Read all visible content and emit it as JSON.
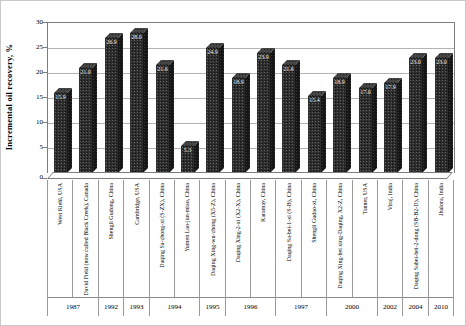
{
  "chart_data": {
    "type": "bar",
    "style": "3d-column",
    "title": "",
    "xlabel": "",
    "ylabel": "Incremental oil recovery, %",
    "ylim": [
      0,
      30
    ],
    "yticks": [
      0,
      5,
      10,
      15,
      20,
      25,
      30
    ],
    "grid": true,
    "legend": false,
    "bar_color": "#2e2e2e",
    "categories": [
      "West Kiehl, USA",
      "David Field (now called Black Creek), Canada",
      "Shengli Gudong, China",
      "Cambridge, USA",
      "Daqing Sa-zhong-xi (S-ZX), China",
      "Yumen Lao-jun-miao, China",
      "Daqing Xing-wu-zhong (X5-Z), China",
      "Daqing Xing-2-xi (X2-X), China",
      "Karamay, China",
      "Daqing Sa-bei-1-xi (S-B), China",
      "Shengli Gudao-xi, China",
      "Daqing Xing-bei xing-Daqing, X2-Z, China",
      "Tanner, USA",
      "Viraj, India",
      "Daqing Sabei-bei-2-dong (SB-B2-D), China",
      "Jhalora, India"
    ],
    "values": [
      15.9,
      21.0,
      26.9,
      28.0,
      21.6,
      5.3,
      24.9,
      18.9,
      23.9,
      21.6,
      15.4,
      18.9,
      17.0,
      17.9,
      23.0,
      23.0
    ],
    "value_labels": [
      "15.9",
      "21.0",
      "26.9",
      "28.0",
      "21.6",
      "5.3",
      "24.9",
      "18.9",
      "23.9",
      "21.6",
      "15.4",
      "18.9",
      "17.0",
      "17.9",
      "23.0",
      "23.0"
    ],
    "year_groups": [
      {
        "label": "1987",
        "span": 2
      },
      {
        "label": "1992",
        "span": 1
      },
      {
        "label": "1993",
        "span": 1
      },
      {
        "label": "1994",
        "span": 2
      },
      {
        "label": "1995",
        "span": 1
      },
      {
        "label": "1996",
        "span": 2
      },
      {
        "label": "1997",
        "span": 2
      },
      {
        "label": "2000",
        "span": 2
      },
      {
        "label": "2002",
        "span": 1
      },
      {
        "label": "2004",
        "span": 1
      },
      {
        "label": "2010",
        "span": 1
      }
    ]
  }
}
